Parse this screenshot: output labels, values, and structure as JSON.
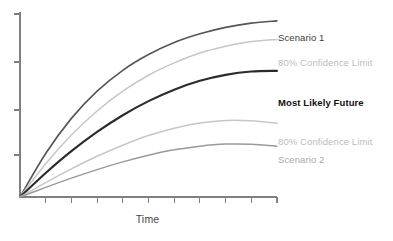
{
  "chart_data": {
    "type": "line",
    "title": "",
    "subtitle": "",
    "xlabel": "Time",
    "ylabel": "",
    "xlim": [
      0,
      10
    ],
    "ylim": [
      0,
      10
    ],
    "grid": false,
    "legend_position": "right-inline-labels",
    "x_tick_count": 10,
    "y_tick_count": 4,
    "x_tick_labels": [],
    "y_tick_labels": [],
    "annotations": [
      "All scenarios originate from a single present-day point and fan outward over time."
    ],
    "series": [
      {
        "name": "Scenario 1",
        "label": "Scenario 1",
        "color": "#555555",
        "width": 1.6,
        "style": "solid",
        "emphasis": "normal",
        "x": [
          0,
          1,
          2,
          3,
          4,
          5,
          6,
          7,
          8,
          9,
          10
        ],
        "values": [
          0.0,
          2.35,
          4.25,
          5.72,
          6.85,
          7.7,
          8.35,
          8.82,
          9.17,
          9.4,
          9.52
        ]
      },
      {
        "name": "80% Confidence Limit (upper)",
        "label": "80% Confidence Limit",
        "color": "#c6c6c6",
        "width": 1.5,
        "style": "solid",
        "emphasis": "normal",
        "x": [
          0,
          1,
          2,
          3,
          4,
          5,
          6,
          7,
          8,
          9,
          10
        ],
        "values": [
          0.0,
          1.8,
          3.35,
          4.65,
          5.72,
          6.58,
          7.25,
          7.78,
          8.15,
          8.4,
          8.52
        ]
      },
      {
        "name": "Most Likely Future",
        "label": "Most Likely Future",
        "color": "#2a2a2a",
        "width": 2.1,
        "style": "solid",
        "emphasis": "bold",
        "x": [
          0,
          1,
          2,
          3,
          4,
          5,
          6,
          7,
          8,
          9,
          10
        ],
        "values": [
          0.0,
          1.3,
          2.48,
          3.52,
          4.42,
          5.18,
          5.8,
          6.28,
          6.6,
          6.78,
          6.82
        ]
      },
      {
        "name": "80% Confidence Limit (lower)",
        "label": "80% Confidence Limit",
        "color": "#c6c6c6",
        "width": 1.5,
        "style": "solid",
        "emphasis": "normal",
        "x": [
          0,
          1,
          2,
          3,
          4,
          5,
          6,
          7,
          8,
          9,
          10
        ],
        "values": [
          0.0,
          0.78,
          1.52,
          2.2,
          2.8,
          3.32,
          3.72,
          4.0,
          4.14,
          4.12,
          3.98
        ]
      },
      {
        "name": "Scenario 2",
        "label": "Scenario 2",
        "color": "#9a9a9a",
        "width": 1.5,
        "style": "solid",
        "emphasis": "normal",
        "x": [
          0,
          1,
          2,
          3,
          4,
          5,
          6,
          7,
          8,
          9,
          10
        ],
        "values": [
          0.0,
          0.52,
          1.02,
          1.48,
          1.9,
          2.26,
          2.55,
          2.75,
          2.86,
          2.85,
          2.74
        ]
      }
    ]
  },
  "axes": {
    "x_axis_label": "Time",
    "y_axis_label": "",
    "axis_color": "#808080"
  },
  "labels": {
    "scenario_1": "Scenario 1",
    "confidence_upper": "80% Confidence Limit",
    "most_likely_future": "Most Likely Future",
    "confidence_lower": "80% Confidence Limit",
    "scenario_2": "Scenario 2"
  },
  "colors": {
    "background": "#ffffff",
    "scenario_1": "#555555",
    "confidence_limit": "#c6c6c6",
    "most_likely_future": "#2a2a2a",
    "scenario_2": "#9a9a9a",
    "axis": "#808080",
    "label_dark": "#3c3c3c",
    "label_light": "#bdbdbd",
    "label_black": "#101010"
  }
}
